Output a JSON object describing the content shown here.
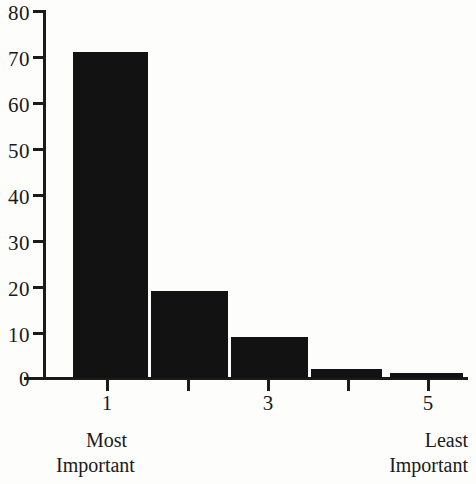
{
  "chart_data": {
    "type": "bar",
    "title": "",
    "subtitle": "",
    "xlabel": "",
    "ylabel": "",
    "categories": [
      "1",
      "2",
      "3",
      "4",
      "5"
    ],
    "values": [
      71,
      19,
      9,
      2,
      1
    ],
    "series": [
      {
        "name": "Percent of respondents",
        "values": [
          71,
          19,
          9,
          2,
          1
        ]
      }
    ],
    "ylim": [
      0,
      80
    ],
    "yticks": [
      0,
      10,
      20,
      30,
      40,
      50,
      60,
      70,
      80
    ],
    "ytick_labels": [
      "0",
      "10",
      "20",
      "30",
      "40",
      "50",
      "60",
      "70",
      "80"
    ],
    "xticks": [
      1,
      2,
      3,
      4,
      5
    ],
    "xtick_labels": [
      "1",
      "",
      "3",
      "",
      "5"
    ],
    "grid": false,
    "legend": null,
    "legend_position": "none",
    "bar_color": "#121212",
    "axis_color": "#1b1b1b",
    "background_color": "#fdfdfc",
    "annotations": {
      "left_caption_line1": "Most",
      "left_caption_line2": "Important",
      "right_caption_line1": "Least",
      "right_caption_line2": "Important"
    }
  },
  "axis": {
    "y": {
      "ticks": [
        {
          "label": "80",
          "value": 80
        },
        {
          "label": "70",
          "value": 70
        },
        {
          "label": "60",
          "value": 60
        },
        {
          "label": "50",
          "value": 50
        },
        {
          "label": "40",
          "value": 40
        },
        {
          "label": "30",
          "value": 30
        },
        {
          "label": "20",
          "value": 20
        },
        {
          "label": "10",
          "value": 10
        },
        {
          "label": "0",
          "value": 0
        }
      ]
    },
    "x": {
      "ticks": [
        {
          "label": "1",
          "value": 1
        },
        {
          "label": "",
          "value": 2
        },
        {
          "label": "3",
          "value": 3
        },
        {
          "label": "",
          "value": 4
        },
        {
          "label": "5",
          "value": 5
        }
      ]
    }
  },
  "captions": {
    "left_line1": "Most",
    "left_line2": "Important",
    "right_line1": "Least",
    "right_line2": "Important"
  }
}
